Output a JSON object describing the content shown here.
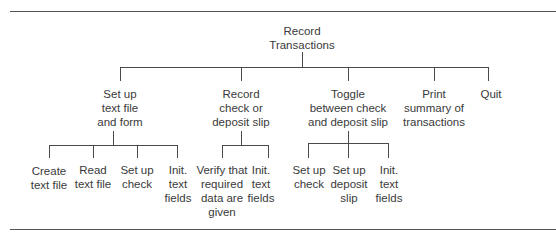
{
  "diagram": {
    "type": "hierarchy-chart",
    "root": {
      "label_lines": [
        "Record",
        "Transactions"
      ],
      "children": [
        {
          "label_lines": [
            "Set up",
            "text file",
            "and form"
          ],
          "children": [
            {
              "label_lines": [
                "Create",
                "text file"
              ]
            },
            {
              "label_lines": [
                "Read",
                "text file"
              ]
            },
            {
              "label_lines": [
                "Set up",
                "check"
              ]
            },
            {
              "label_lines": [
                "Init.",
                "text",
                "fields"
              ]
            }
          ]
        },
        {
          "label_lines": [
            "Record",
            "check or",
            "deposit slip"
          ],
          "children": [
            {
              "label_lines": [
                "Verify that",
                "required",
                "data are",
                "given"
              ]
            },
            {
              "label_lines": [
                "Init.",
                "text",
                "fields"
              ]
            }
          ]
        },
        {
          "label_lines": [
            "Toggle",
            "between check",
            "and deposit slip"
          ],
          "children": [
            {
              "label_lines": [
                "Set up",
                "check"
              ]
            },
            {
              "label_lines": [
                "Set up",
                "deposit",
                "slip"
              ]
            },
            {
              "label_lines": [
                "Init.",
                "text",
                "fields"
              ]
            }
          ]
        },
        {
          "label_lines": [
            "Print",
            "summary of",
            "transactions"
          ]
        },
        {
          "label_lines": [
            "Quit"
          ]
        }
      ]
    }
  },
  "colors": {
    "line": "#4a4a4a",
    "text": "#3a3a3a",
    "background": "#ffffff"
  }
}
